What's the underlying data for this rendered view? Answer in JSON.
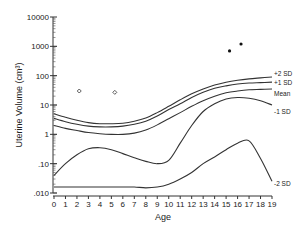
{
  "chart_data": {
    "type": "line",
    "title": "",
    "xlabel": "Age",
    "ylabel": "Uterine Volume (cm³)",
    "yscale": "log",
    "xlim": [
      0,
      19
    ],
    "ylim": [
      0.01,
      10000
    ],
    "grid": false,
    "x_ticks": [
      0,
      1,
      2,
      3,
      4,
      5,
      6,
      7,
      8,
      9,
      10,
      11,
      12,
      13,
      14,
      15,
      16,
      17,
      18,
      19
    ],
    "y_ticks": [
      {
        "value": 10000,
        "label": "10000"
      },
      {
        "value": 1000,
        "label": "1000"
      },
      {
        "value": 100,
        "label": "100"
      },
      {
        "value": 10,
        "label": "10"
      },
      {
        "value": 1,
        "label": "1"
      },
      {
        "value": 0.1,
        "label": ".10"
      },
      {
        "value": 0.01,
        "label": ".010"
      }
    ],
    "x": [
      0,
      1,
      2,
      3,
      4,
      5,
      6,
      7,
      8,
      9,
      10,
      11,
      12,
      13,
      14,
      15,
      16,
      17,
      18,
      19
    ],
    "series": [
      {
        "name": "+2 SD",
        "values": [
          5.0,
          3.8,
          3.0,
          2.5,
          2.3,
          2.3,
          2.4,
          2.8,
          3.6,
          5.5,
          9,
          15,
          24,
          35,
          48,
          60,
          70,
          78,
          84,
          90
        ]
      },
      {
        "name": "+1 SD",
        "values": [
          3.5,
          2.7,
          2.2,
          1.9,
          1.8,
          1.8,
          1.9,
          2.2,
          2.8,
          4.2,
          7,
          11,
          18,
          27,
          37,
          45,
          52,
          56,
          58,
          60
        ]
      },
      {
        "name": "Mean",
        "values": [
          2.0,
          1.6,
          1.35,
          1.15,
          1.05,
          1.0,
          1.0,
          1.1,
          1.4,
          2.1,
          3.4,
          5.5,
          9,
          14,
          20,
          26,
          30,
          33,
          34,
          35
        ]
      },
      {
        "name": "-1 SD",
        "values": [
          0.04,
          0.1,
          0.2,
          0.32,
          0.35,
          0.3,
          0.22,
          0.16,
          0.12,
          0.1,
          0.13,
          0.5,
          2.0,
          6,
          11,
          16,
          18,
          17,
          14,
          10
        ]
      },
      {
        "name": "-2 SD",
        "values": [
          0.016,
          0.016,
          0.016,
          0.016,
          0.016,
          0.016,
          0.016,
          0.016,
          0.015,
          0.016,
          0.02,
          0.03,
          0.05,
          0.1,
          0.17,
          0.3,
          0.5,
          0.6,
          0.15,
          0.025
        ]
      }
    ],
    "points": [
      {
        "name": "open-diamond",
        "x": 2.2,
        "y": 30
      },
      {
        "name": "open-diamond",
        "x": 5.3,
        "y": 27
      },
      {
        "name": "filled-dot",
        "x": 15.3,
        "y": 700
      },
      {
        "name": "filled-dot",
        "x": 16.3,
        "y": 1200
      }
    ],
    "legend": {
      "position": "right-inline",
      "labels": [
        "+2 SD",
        "+1 SD",
        "Mean",
        "-1 SD",
        "-2 SD"
      ]
    }
  }
}
